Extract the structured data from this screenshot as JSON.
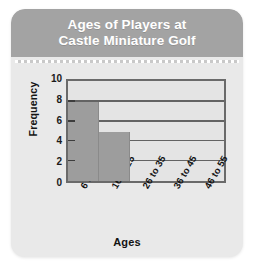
{
  "card": {
    "header": {
      "title_line1": "Ages of Players at",
      "title_line2": "Castle Miniature Golf",
      "background_color": "#a3a3a3",
      "text_color": "#ffffff"
    },
    "background_color": "#e9e9e9"
  },
  "chart_data": {
    "type": "bar",
    "title": "Ages of Players at Castle Miniature Golf",
    "categories": [
      "6 to 15",
      "16 to 25",
      "26 to 35",
      "36 to 45",
      "46 to 55"
    ],
    "values": [
      8,
      5,
      0,
      0,
      0
    ],
    "xlabel": "Ages",
    "ylabel": "Frequency",
    "ylim": [
      0,
      10
    ],
    "yticks": [
      0,
      2,
      4,
      6,
      8,
      10
    ],
    "ytick_labels": [
      "0",
      "2",
      "4",
      "6",
      "8",
      "10"
    ],
    "gridlines": [
      2,
      4,
      6,
      8
    ],
    "grid": true,
    "legend": "none",
    "bar_color": "#9d9d9d",
    "plot_background_color": "#e4e4e4",
    "axis_color": "#6a6a6a"
  }
}
